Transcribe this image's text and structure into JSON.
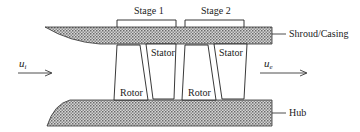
{
  "diagram": {
    "stages": [
      {
        "label": "Stage 1",
        "rotor_label": "Rotor",
        "stator_label": "Stator"
      },
      {
        "label": "Stage 2",
        "rotor_label": "Rotor",
        "stator_label": "Stator"
      }
    ],
    "walls": {
      "shroud_label": "Shroud/Casing",
      "hub_label": "Hub"
    },
    "flow": {
      "inlet_symbol": "u",
      "inlet_subscript": "i",
      "exit_symbol": "u",
      "exit_subscript": "e"
    },
    "colors": {
      "line": "#222222",
      "hatch_dark": "#6e6e6e",
      "hatch_light": "#d8d8d8"
    }
  }
}
